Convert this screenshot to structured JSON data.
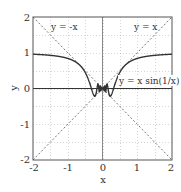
{
  "chart_data": {
    "type": "line",
    "title": "",
    "xlabel": "x",
    "ylabel": "y",
    "xlim": [
      -2,
      2
    ],
    "ylim": [
      -2,
      2
    ],
    "grid": true,
    "grid_step": 0.5,
    "xticks": [
      "-2",
      "-1",
      "0",
      "1",
      "2"
    ],
    "yticks": [
      "2",
      "1",
      "0",
      "-1",
      "-2"
    ],
    "legend": null,
    "series": [
      {
        "name": "y = x sin(1/x)",
        "style": "solid",
        "color": "#333333",
        "x": [
          -2,
          -1.5,
          -1,
          -0.75,
          -0.5,
          -0.4,
          -0.3,
          -0.2225,
          -0.15,
          -0.1,
          -0.05,
          0,
          0.05,
          0.1,
          0.15,
          0.2225,
          0.3,
          0.4,
          0.5,
          0.75,
          1,
          1.5,
          2
        ],
        "values": [
          0.959,
          0.943,
          0.841,
          0.729,
          0.455,
          0.239,
          -0.051,
          -0.217,
          0.056,
          -0.054,
          0.046,
          0,
          0.046,
          -0.054,
          0.056,
          -0.217,
          -0.051,
          0.239,
          0.455,
          0.729,
          0.841,
          0.943,
          0.959
        ]
      },
      {
        "name": "y = x",
        "style": "dotted",
        "color": "#555555",
        "x": [
          -2,
          2
        ],
        "values": [
          -2,
          2
        ]
      },
      {
        "name": "y = -x",
        "style": "dotted",
        "color": "#555555",
        "x": [
          -2,
          2
        ],
        "values": [
          2,
          -2
        ]
      }
    ],
    "annotations": [
      {
        "text": "y = -x",
        "x": -1.05,
        "y": 1.75
      },
      {
        "text": "y = x",
        "x": 0.95,
        "y": 1.75
      },
      {
        "text": "y = x sin(1/x)",
        "x": 0.45,
        "y": 0.1
      }
    ]
  },
  "labels": {
    "xlabel": "x",
    "ylabel": "y",
    "xticks": [
      "-2",
      "-1",
      "0",
      "1",
      "2"
    ],
    "yticks": [
      "2",
      "1",
      "0",
      "-1",
      "-2"
    ],
    "annot_neg": "y = -x",
    "annot_pos": "y = x",
    "annot_curve": "y = x sin(1/x)"
  },
  "colors": {
    "frame": "#555555",
    "grid": "#bbbbbb",
    "curve": "#333333",
    "diag": "#666666"
  }
}
